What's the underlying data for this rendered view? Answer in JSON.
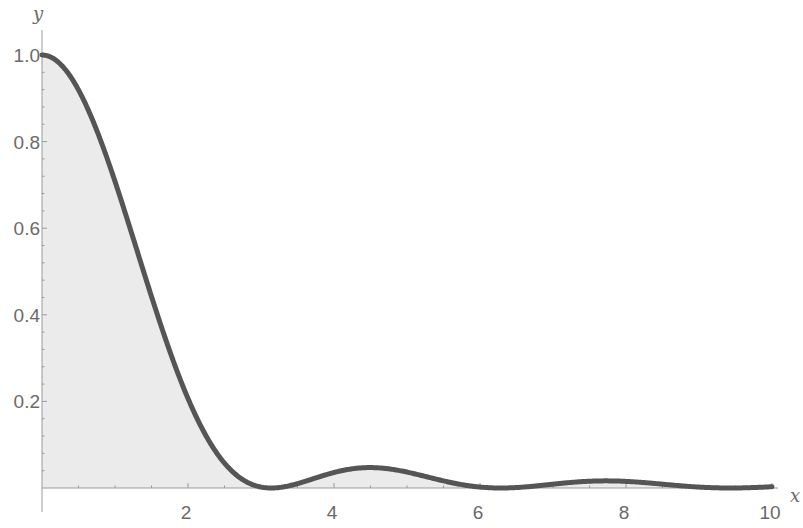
{
  "chart_data": {
    "type": "area",
    "title": "",
    "xlabel": "x",
    "ylabel": "y",
    "function": "(sin(x)/x)^2",
    "xlim": [
      0,
      10
    ],
    "ylim": [
      0,
      1.0
    ],
    "x_ticks": [
      2,
      4,
      6,
      8,
      10
    ],
    "x_tick_labels": [
      "2",
      "4",
      "6",
      "8",
      "10"
    ],
    "y_ticks": [
      0.2,
      0.4,
      0.6,
      0.8,
      1.0
    ],
    "y_tick_labels": [
      "0.2",
      "0.4",
      "0.6",
      "0.8",
      "1.0"
    ],
    "grid": false,
    "filled_to_axis": true,
    "series": [
      {
        "name": "sinc^2",
        "x": [
          0,
          0.5,
          1,
          1.5,
          2,
          2.5,
          3,
          3.1416,
          3.5,
          4,
          4.4934,
          5,
          5.5,
          6,
          6.2832,
          6.5,
          7,
          7.7253,
          8,
          8.5,
          9,
          9.4248,
          10
        ],
        "y": [
          1.0,
          0.9194,
          0.7081,
          0.4422,
          0.2067,
          0.0573,
          0.0022,
          0.0,
          0.01,
          0.0358,
          0.0472,
          0.0368,
          0.0163,
          0.0022,
          0.0,
          0.001,
          0.0088,
          0.0165,
          0.0153,
          0.0085,
          0.0021,
          0.0,
          0.003
        ]
      }
    ],
    "colors": {
      "curve": "#555555",
      "fill": "#ebebeb",
      "text": "#6a6a6a",
      "axis": "#9a9a9a"
    }
  }
}
